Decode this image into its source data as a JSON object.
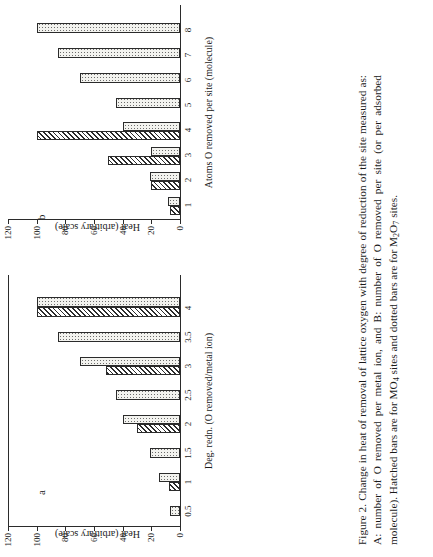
{
  "figure": {
    "label": "Figure 2.",
    "caption_text": "Change in heat of removal of lattice oxygen with degree of reduction of the site measured as: A: number of O removed per metal ion, and B: number of O removed per site (or per adsorbed molecule). Hatched bars are for MO4 sites and dotted bars are for M2O7 sites.",
    "caption_runs": [
      {
        "t": "Change  in  heat  of  removal  of  lattice  oxygen  with  degree  of  reduction of the site measured as: A: number of O removed per metal ion, and B: number of O removed per site (or per adsorbed molecule).  Hatched bars are for MO",
        "sub": null
      },
      {
        "t": "4",
        "sub": true
      },
      {
        "t": " sites and dotted bars are for M",
        "sub": null
      },
      {
        "t": "2",
        "sub": true
      },
      {
        "t": "O",
        "sub": null
      },
      {
        "t": "7",
        "sub": true
      },
      {
        "t": " sites.",
        "sub": null
      }
    ]
  },
  "legend_semantics": {
    "hatched_label": "MO4 sites",
    "dotted_label": "M2O7 sites"
  },
  "panel_a": {
    "letter": "a",
    "y_axis_title": "Heat (arbitrary scale)",
    "x_axis_title": "Deg. redn. (O removed/metal ion)"
  },
  "panel_b": {
    "letter": "b",
    "y_axis_title": "Heat (arbitrary scale)",
    "x_axis_title": "Atoms O removed per site (molecule)"
  },
  "chart_data": [
    {
      "id": "panel_a",
      "type": "bar",
      "orientation": "horizontal-grouped",
      "title": "a",
      "xlabel": "Deg. redn. (O removed/metal ion)",
      "ylabel": "Heat (arbitrary scale)",
      "ylim": [
        0,
        120
      ],
      "yticks": [
        0,
        20,
        40,
        60,
        80,
        100,
        120
      ],
      "grid": false,
      "legend": "none",
      "categories": [
        "0.5",
        "1",
        "1.5",
        "2",
        "2.5",
        "3",
        "3.5",
        "4"
      ],
      "series": [
        {
          "name": "MO4 sites (hatched)",
          "values": [
            null,
            8,
            null,
            30,
            null,
            52,
            null,
            100
          ]
        },
        {
          "name": "M2O7 sites (dotted)",
          "values": [
            7,
            15,
            21,
            40,
            45,
            70,
            85,
            100
          ]
        }
      ]
    },
    {
      "id": "panel_b",
      "type": "bar",
      "orientation": "horizontal-grouped",
      "title": "b",
      "xlabel": "Atoms O removed per site (molecule)",
      "ylabel": "Heat (arbitrary scale)",
      "ylim": [
        0,
        120
      ],
      "yticks": [
        0,
        20,
        40,
        60,
        80,
        100,
        120
      ],
      "grid": false,
      "legend": "none",
      "categories": [
        "1",
        "2",
        "3",
        "4",
        "5",
        "6",
        "7",
        "8"
      ],
      "series": [
        {
          "name": "MO4 sites (hatched)",
          "values": [
            7,
            20,
            50,
            100,
            null,
            null,
            null,
            null
          ]
        },
        {
          "name": "M2O7 sites (dotted)",
          "values": [
            8,
            21,
            20,
            40,
            45,
            70,
            85,
            100
          ]
        }
      ]
    }
  ]
}
